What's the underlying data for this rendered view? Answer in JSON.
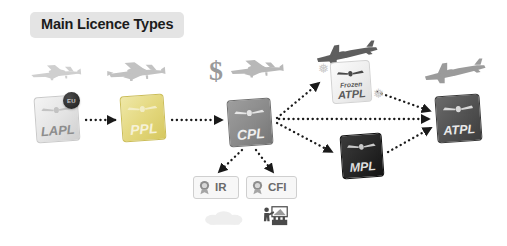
{
  "title": {
    "text": "Main Licence Types"
  },
  "cards": [
    {
      "id": "lapl",
      "label": "LAPL",
      "sub": "",
      "badge": "EU",
      "tone": "light",
      "icon": "licence-card-icon"
    },
    {
      "id": "ppl",
      "label": "PPL",
      "sub": "",
      "badge": "",
      "tone": "yellow",
      "icon": "licence-card-icon"
    },
    {
      "id": "cpl",
      "label": "CPL",
      "sub": "",
      "badge": "",
      "tone": "mid",
      "icon": "licence-card-icon"
    },
    {
      "id": "frozen",
      "label": "ATPL",
      "sub": "Frozen",
      "badge": "",
      "tone": "frozen",
      "icon": "licence-card-icon"
    },
    {
      "id": "mpl",
      "label": "MPL",
      "sub": "",
      "badge": "",
      "tone": "black",
      "icon": "licence-card-icon"
    },
    {
      "id": "atpl",
      "label": "ATPL",
      "sub": "",
      "badge": "",
      "tone": "dark",
      "icon": "licence-card-icon"
    }
  ],
  "ratings": [
    {
      "id": "ir",
      "label": "IR",
      "icon": "rosette-seal-icon"
    },
    {
      "id": "cfi",
      "label": "CFI",
      "icon": "rosette-seal-icon"
    }
  ],
  "symbols": {
    "dollar": "$",
    "snowflake": "❅"
  },
  "icons": {
    "plane_lapl": "light-prop-plane-icon",
    "plane_ppl": "prop-plane-icon",
    "plane_cpl": "prop-plane-icon",
    "plane_frozen": "jet-airliner-icon",
    "plane_atpl": "jet-airliner-icon",
    "cloud": "cloud-icon",
    "classroom": "classroom-instructor-icon",
    "eu_badge": "eu-roundel-icon"
  },
  "colors": {
    "background": "#ffffff",
    "title_badge": "#e4e4e4",
    "title_text": "#1c1c1c",
    "ppl_card": "#e4d87f",
    "cpl_card": "#8a8a8a",
    "mpl_card": "#262626",
    "atpl_card": "#515151",
    "connector": "#1a1a1a"
  },
  "flow": {
    "edges": [
      {
        "from": "lapl",
        "to": "ppl"
      },
      {
        "from": "ppl",
        "to": "cpl"
      },
      {
        "from": "cpl",
        "to": "frozen"
      },
      {
        "from": "cpl",
        "to": "atpl"
      },
      {
        "from": "cpl",
        "to": "mpl"
      },
      {
        "from": "cpl",
        "to": "ir"
      },
      {
        "from": "cpl",
        "to": "cfi"
      },
      {
        "from": "frozen",
        "to": "atpl"
      },
      {
        "from": "mpl",
        "to": "atpl"
      }
    ]
  }
}
